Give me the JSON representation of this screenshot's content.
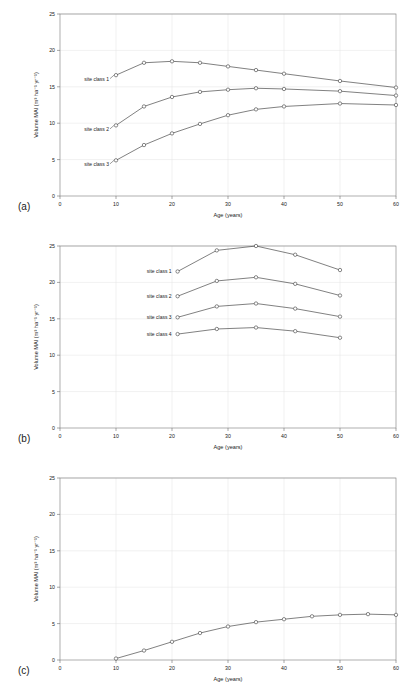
{
  "figure": {
    "panels": [
      {
        "panel_label": "(a)",
        "chart_data": {
          "type": "line",
          "title": "",
          "xlabel": "Age (years)",
          "ylabel": "Volume MAI (m³ ha⁻¹ yr⁻¹)",
          "xlim": [
            0,
            60
          ],
          "ylim": [
            0,
            25
          ],
          "xticks": [
            0,
            10,
            20,
            30,
            40,
            50,
            60
          ],
          "yticks": [
            0,
            5,
            10,
            15,
            20,
            25
          ],
          "grid": true,
          "legend_position": "inline-labels",
          "series": [
            {
              "name": "site class 1",
              "x": [
                10,
                15,
                20,
                25,
                30,
                35,
                40,
                50,
                60
              ],
              "values": [
                16.6,
                18.3,
                18.5,
                18.3,
                17.8,
                17.3,
                16.8,
                15.8,
                14.9
              ]
            },
            {
              "name": "site class 2",
              "x": [
                10,
                15,
                20,
                25,
                30,
                35,
                40,
                50,
                60
              ],
              "values": [
                9.7,
                12.3,
                13.6,
                14.3,
                14.6,
                14.8,
                14.7,
                14.4,
                13.8
              ]
            },
            {
              "name": "site class 3",
              "x": [
                10,
                15,
                20,
                25,
                30,
                35,
                40,
                50,
                60
              ],
              "values": [
                4.9,
                7.0,
                8.6,
                9.9,
                11.1,
                11.9,
                12.3,
                12.7,
                12.5
              ]
            }
          ]
        }
      },
      {
        "panel_label": "(b)",
        "chart_data": {
          "type": "line",
          "title": "",
          "xlabel": "Age (years)",
          "ylabel": "Volume MAI (m³ ha⁻¹ yr⁻¹)",
          "xlim": [
            0,
            60
          ],
          "ylim": [
            0,
            25
          ],
          "xticks": [
            0,
            10,
            20,
            30,
            40,
            50,
            60
          ],
          "yticks": [
            0,
            5,
            10,
            15,
            20,
            25
          ],
          "grid": true,
          "legend_position": "inline-labels",
          "series": [
            {
              "name": "site class 1",
              "x": [
                21,
                28,
                35,
                42,
                50
              ],
              "values": [
                21.5,
                24.4,
                25.0,
                23.8,
                21.7
              ]
            },
            {
              "name": "site class 2",
              "x": [
                21,
                28,
                35,
                42,
                50
              ],
              "values": [
                18.1,
                20.2,
                20.7,
                19.8,
                18.2
              ]
            },
            {
              "name": "site class 3",
              "x": [
                21,
                28,
                35,
                42,
                50
              ],
              "values": [
                15.2,
                16.7,
                17.1,
                16.4,
                15.3
              ]
            },
            {
              "name": "site class 4",
              "x": [
                21,
                28,
                35,
                42,
                50
              ],
              "values": [
                12.9,
                13.6,
                13.8,
                13.3,
                12.4
              ]
            }
          ]
        }
      },
      {
        "panel_label": "(c)",
        "chart_data": {
          "type": "line",
          "title": "",
          "xlabel": "Age (years)",
          "ylabel": "Volume MAI (m³ ha⁻¹ yr⁻¹)",
          "xlim": [
            0,
            60
          ],
          "ylim": [
            0,
            25
          ],
          "xticks": [
            0,
            10,
            20,
            30,
            40,
            50,
            60
          ],
          "yticks": [
            0,
            5,
            10,
            15,
            20,
            25
          ],
          "grid": true,
          "legend_position": "none",
          "series": [
            {
              "name": "",
              "x": [
                10,
                15,
                20,
                25,
                30,
                35,
                40,
                45,
                50,
                55,
                60
              ],
              "values": [
                0.2,
                1.3,
                2.5,
                3.7,
                4.6,
                5.2,
                5.6,
                6.0,
                6.2,
                6.3,
                6.2
              ]
            }
          ]
        }
      }
    ]
  }
}
